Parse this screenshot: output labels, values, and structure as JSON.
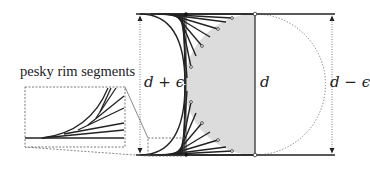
{
  "diagram": {
    "labels": {
      "callout": "pesky rim segments",
      "left_dimension": "d + ϵ",
      "center_dimension": "d",
      "right_dimension": "d − ϵ"
    },
    "colors": {
      "stroke": "#222222",
      "fill_half_disc": "#dcdcdc",
      "dotted": "#555555",
      "background": "#ffffff"
    }
  }
}
